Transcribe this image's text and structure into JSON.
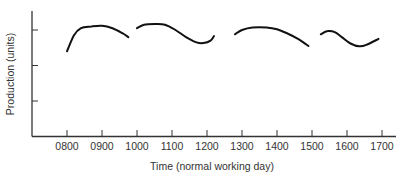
{
  "chart_data": {
    "type": "line",
    "title": "",
    "xlabel": "Time (normal working day)",
    "ylabel": "Production (units)",
    "x_ticks": [
      "0800",
      "0900",
      "1000",
      "1100",
      "1200",
      "1300",
      "1400",
      "1500",
      "1600",
      "1700"
    ],
    "y_ticks": [
      "",
      "",
      ""
    ],
    "y_ticks_note": "three unlabeled tick marks on y axis",
    "grid": false,
    "legend": null,
    "xlim_hours": [
      7.0,
      17.4
    ],
    "ylim_units": [
      0,
      3.5
    ],
    "series": [
      {
        "name": "Session 1 (0800–0945)",
        "x_hours": [
          8.0,
          8.2,
          8.4,
          8.7,
          9.0,
          9.3,
          9.6,
          9.75
        ],
        "values": [
          2.4,
          2.85,
          3.05,
          3.1,
          3.12,
          3.05,
          2.9,
          2.8
        ]
      },
      {
        "name": "Session 2 (1000–1220)",
        "x_hours": [
          10.0,
          10.2,
          10.5,
          10.8,
          11.1,
          11.4,
          11.7,
          11.9,
          12.1,
          12.2
        ],
        "values": [
          3.05,
          3.15,
          3.17,
          3.15,
          3.0,
          2.8,
          2.65,
          2.63,
          2.7,
          2.83
        ]
      },
      {
        "name": "Session 3 (1300–1455)",
        "x_hours": [
          12.8,
          13.0,
          13.3,
          13.7,
          14.0,
          14.3,
          14.6,
          14.9
        ],
        "values": [
          2.88,
          3.0,
          3.07,
          3.07,
          3.02,
          2.9,
          2.75,
          2.55
        ]
      },
      {
        "name": "Session 4 (1520–1690)",
        "x_hours": [
          15.25,
          15.45,
          15.65,
          15.85,
          16.1,
          16.35,
          16.55,
          16.9
        ],
        "values": [
          2.88,
          2.97,
          2.94,
          2.8,
          2.62,
          2.54,
          2.58,
          2.75
        ]
      }
    ]
  }
}
